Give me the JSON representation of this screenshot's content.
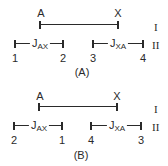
{
  "panels": [
    {
      "caption": "(A)",
      "row_I": {
        "label": "I",
        "left_label": "A",
        "right_label": "X"
      },
      "row_II": {
        "label": "II",
        "left_pair": {
          "j_main": "J",
          "j_sub": "AX",
          "left_num": "1",
          "right_num": "2"
        },
        "right_pair": {
          "j_main": "J",
          "j_sub": "XA",
          "left_num": "3",
          "right_num": "4"
        }
      }
    },
    {
      "caption": "(B)",
      "row_I": {
        "label": "I",
        "left_label": "A",
        "right_label": "X"
      },
      "row_II": {
        "label": "II",
        "left_pair": {
          "j_main": "J",
          "j_sub": "AX",
          "left_num": "2",
          "right_num": "1"
        },
        "right_pair": {
          "j_main": "J",
          "j_sub": "XA",
          "left_num": "4",
          "right_num": "3"
        }
      }
    }
  ],
  "colors": {
    "ink": "#2a2a2a",
    "background": "#ffffff"
  }
}
